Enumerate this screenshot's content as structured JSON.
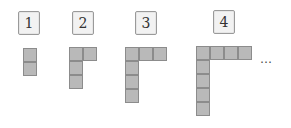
{
  "figures": [
    {
      "label": "1",
      "column_cells": 2,
      "row_cells": 1
    },
    {
      "label": "2",
      "column_cells": 3,
      "row_cells": 2
    },
    {
      "label": "3",
      "column_cells": 4,
      "row_cells": 3
    },
    {
      "label": "4",
      "column_cells": 5,
      "row_cells": 4
    }
  ],
  "continuation": "…",
  "colors": {
    "cell_fill": "#b9b9b9",
    "cell_border": "#8c8c8c",
    "label_bg": "#f2f2f2"
  }
}
